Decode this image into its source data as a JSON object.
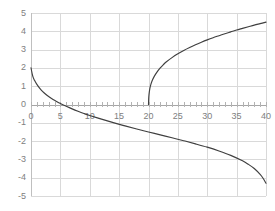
{
  "chart_data": {
    "type": "line",
    "title": "",
    "xlabel": "",
    "ylabel": "",
    "xlim": [
      0,
      40
    ],
    "ylim": [
      -5,
      5
    ],
    "grid": true,
    "legend": false,
    "x_ticks": [
      0,
      5,
      10,
      15,
      20,
      25,
      30,
      35,
      40
    ],
    "x_tick_labels": [
      "0",
      "5",
      "10",
      "15",
      "20",
      "25",
      "30",
      "35",
      "40"
    ],
    "x_minor_tick_step": 1,
    "y_ticks": [
      -5,
      -4,
      -3,
      -2,
      -1,
      0,
      1,
      2,
      3,
      4,
      5
    ],
    "y_tick_labels": [
      "5",
      "4",
      "3",
      "2",
      "1",
      "0",
      "-1",
      "-2",
      "-3",
      "-4",
      "-5"
    ],
    "line_color": "#3f3f3f",
    "grid_color": "#d9d9d9",
    "axis_color": "#a6a6a6",
    "tick_label_color": "#808080",
    "series": [
      {
        "name": "lower-branch",
        "points": [
          [
            0,
            2.0
          ],
          [
            0.3,
            1.55
          ],
          [
            0.6,
            1.32
          ],
          [
            1,
            1.1
          ],
          [
            1.5,
            0.88
          ],
          [
            2,
            0.7
          ],
          [
            2.5,
            0.56
          ],
          [
            3,
            0.44
          ],
          [
            3.5,
            0.33
          ],
          [
            4,
            0.23
          ],
          [
            4.5,
            0.14
          ],
          [
            5,
            0.05
          ],
          [
            6,
            -0.1
          ],
          [
            7,
            -0.24
          ],
          [
            8,
            -0.37
          ],
          [
            9,
            -0.49
          ],
          [
            10,
            -0.6
          ],
          [
            12,
            -0.8
          ],
          [
            14,
            -0.99
          ],
          [
            16,
            -1.17
          ],
          [
            18,
            -1.34
          ],
          [
            20,
            -1.5
          ],
          [
            22,
            -1.66
          ],
          [
            24,
            -1.82
          ],
          [
            26,
            -1.98
          ],
          [
            28,
            -2.15
          ],
          [
            30,
            -2.33
          ],
          [
            32,
            -2.54
          ],
          [
            34,
            -2.78
          ],
          [
            36,
            -3.08
          ],
          [
            37,
            -3.27
          ],
          [
            38,
            -3.5
          ],
          [
            39,
            -3.82
          ],
          [
            39.5,
            -4.03
          ],
          [
            40,
            -4.3
          ]
        ]
      },
      {
        "name": "upper-branch",
        "points": [
          [
            20,
            0
          ],
          [
            20.05,
            0.42
          ],
          [
            20.15,
            0.72
          ],
          [
            20.3,
            0.98
          ],
          [
            20.6,
            1.28
          ],
          [
            21,
            1.55
          ],
          [
            21.5,
            1.8
          ],
          [
            22,
            2.0
          ],
          [
            22.5,
            2.17
          ],
          [
            23,
            2.32
          ],
          [
            24,
            2.56
          ],
          [
            25,
            2.77
          ],
          [
            26,
            2.95
          ],
          [
            27,
            3.11
          ],
          [
            28,
            3.26
          ],
          [
            29,
            3.4
          ],
          [
            30,
            3.53
          ],
          [
            31,
            3.65
          ],
          [
            32,
            3.76
          ],
          [
            33,
            3.87
          ],
          [
            34,
            3.97
          ],
          [
            35,
            4.07
          ],
          [
            36,
            4.16
          ],
          [
            37,
            4.25
          ],
          [
            38,
            4.34
          ],
          [
            39,
            4.42
          ],
          [
            40,
            4.5
          ]
        ]
      }
    ]
  }
}
